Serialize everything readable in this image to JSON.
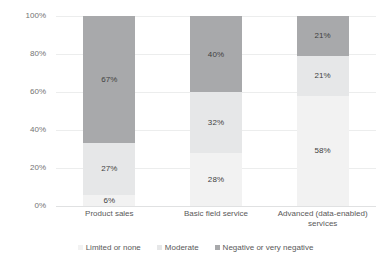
{
  "chart_data": {
    "type": "bar",
    "subtype": "stacked-100-percent",
    "title": "",
    "xlabel": "",
    "ylabel": "",
    "ylim": [
      0,
      100
    ],
    "ytick_labels": [
      "0%",
      "20%",
      "40%",
      "60%",
      "80%",
      "100%"
    ],
    "ytick_values": [
      0,
      20,
      40,
      60,
      80,
      100
    ],
    "grid": true,
    "legend_position": "bottom",
    "categories": [
      "Product sales",
      "Basic field service",
      "Advanced (data-enabled) services"
    ],
    "category_lines": [
      [
        "Product sales"
      ],
      [
        "Basic field service"
      ],
      [
        "Advanced (data-enabled)",
        "services"
      ]
    ],
    "series": [
      {
        "name": "Limited or none",
        "color": "#f2f2f2",
        "values": [
          6,
          28,
          58
        ],
        "labels": [
          "6%",
          "28%",
          "58%"
        ]
      },
      {
        "name": "Moderate",
        "color": "#e6e7e8",
        "values": [
          27,
          32,
          21
        ],
        "labels": [
          "27%",
          "32%",
          "21%"
        ]
      },
      {
        "name": "Negative or very negative",
        "color": "#a8a9ab",
        "values": [
          67,
          40,
          21
        ],
        "labels": [
          "67%",
          "40%",
          "21%"
        ]
      }
    ]
  },
  "legend": {
    "items": [
      {
        "label": "Limited or none",
        "color": "#f2f2f2"
      },
      {
        "label": "Moderate",
        "color": "#e6e7e8"
      },
      {
        "label": "Negative or very negative",
        "color": "#a8a9ab"
      }
    ]
  },
  "axis": {
    "y_labels": [
      "100%",
      "80%",
      "60%",
      "40%",
      "20%",
      "0%"
    ]
  }
}
